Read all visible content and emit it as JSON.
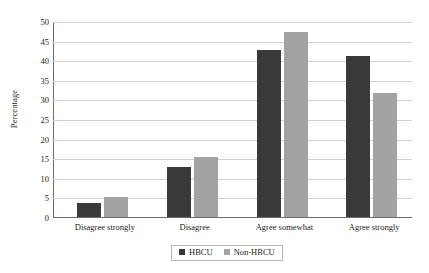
{
  "chart_data": {
    "type": "bar",
    "title": "",
    "xlabel": "",
    "ylabel": "Percentage",
    "ylim": [
      0,
      50
    ],
    "yticks": [
      0,
      5,
      10,
      15,
      20,
      25,
      30,
      35,
      40,
      45,
      50
    ],
    "grid": true,
    "legend_position": "bottom",
    "categories": [
      "Disagree strongly",
      "Disagree",
      "Agree somewhat",
      "Agree strongly"
    ],
    "series": [
      {
        "name": "HBCU",
        "color": "#393939",
        "values": [
          3.7,
          12.8,
          42.5,
          41.1
        ]
      },
      {
        "name": "Non-HBCU",
        "color": "#a3a3a3",
        "values": [
          5.0,
          15.3,
          47.2,
          31.7
        ]
      }
    ]
  },
  "axes": {
    "y_title": "Percentage",
    "tick_labels": [
      "0",
      "5",
      "10",
      "15",
      "20",
      "25",
      "30",
      "35",
      "40",
      "45",
      "50"
    ]
  },
  "legend": {
    "items": [
      {
        "label": "HBCU"
      },
      {
        "label": "Non-HBCU"
      }
    ]
  }
}
